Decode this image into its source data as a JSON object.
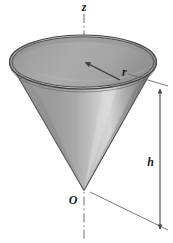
{
  "figure": {
    "type": "geometry-diagram",
    "background_color": "#ffffff",
    "width": 173,
    "height": 243
  },
  "labels": {
    "axis_z": "z",
    "radius_r": "r",
    "origin_O": "O",
    "height_h": "h"
  },
  "geometry": {
    "apex": {
      "x": 84,
      "y": 190
    },
    "rim_center": {
      "x": 83,
      "y": 62
    },
    "rim_radius_x": 74,
    "rim_radius_y": 27,
    "axis_x": 84,
    "axis_top_y": 14,
    "axis_bottom_y": 241,
    "dimension_line_x": 160,
    "dimension_top_y": 88,
    "dimension_bottom_y": 232
  },
  "colors": {
    "outline": "#3a3a3a",
    "cone_dark": "#6e6e6e",
    "cone_mid": "#9a9a9a",
    "cone_light": "#d2d2d2",
    "interior": "#a6a6a6",
    "interior_shadow": "#8f8f8f",
    "rim_band": "#bdbdbd",
    "axis_line": "#9b9b9b",
    "dimension_line": "#6d6d6d",
    "label_color": "#1a1a1a"
  },
  "elements": {
    "z_axis_name": "vertical-axis-dash-dot",
    "radius_arrow_name": "radius-arrow",
    "height_arrow_name": "height-dimension-arrow",
    "cone_name": "cone-solid"
  }
}
